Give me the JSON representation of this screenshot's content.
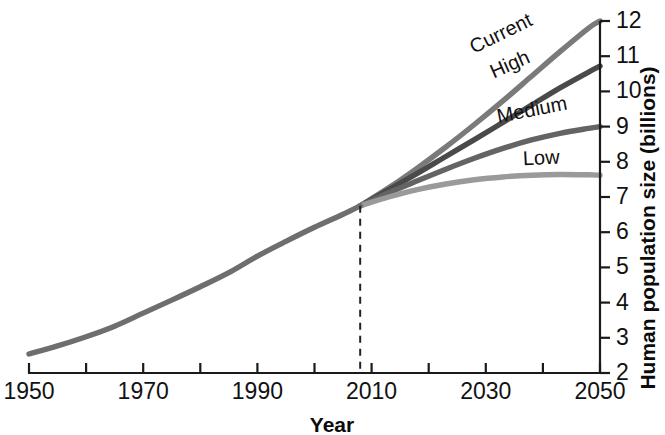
{
  "chart_data": {
    "type": "line",
    "title": "",
    "xlabel": "Year",
    "ylabel": "Human population size (billions)",
    "xlim": [
      1950,
      2050
    ],
    "ylim": [
      2,
      12
    ],
    "grid": false,
    "legend_position": "inline-end-of-line",
    "x_ticks": [
      1950,
      1960,
      1970,
      1980,
      1990,
      2000,
      2010,
      2020,
      2030,
      2040,
      2050
    ],
    "x_tick_labels": [
      "1950",
      "",
      "1970",
      "",
      "1990",
      "",
      "2010",
      "",
      "2030",
      "",
      "2050"
    ],
    "y_ticks": [
      2,
      3,
      4,
      5,
      6,
      7,
      8,
      9,
      10,
      11,
      12
    ],
    "y_tick_labels": [
      "2",
      "3",
      "4",
      "5",
      "6",
      "7",
      "8",
      "9",
      "10",
      "11",
      "12"
    ],
    "y_axis_side": "right",
    "annotations": [
      {
        "name": "present-day-marker",
        "type": "vline",
        "x": 2008,
        "style": "dashed",
        "label": ""
      }
    ],
    "x": [
      1950,
      1955,
      1960,
      1965,
      1970,
      1975,
      1980,
      1985,
      1990,
      1995,
      2000,
      2005,
      2008
    ],
    "historical": {
      "name": "Historical",
      "color": "#6e6e6e",
      "values": [
        2.54,
        2.77,
        3.03,
        3.33,
        3.7,
        4.07,
        4.45,
        4.85,
        5.32,
        5.74,
        6.14,
        6.51,
        6.75
      ]
    },
    "series": [
      {
        "name": "Current",
        "color": "#7a7a7a",
        "label": "Current",
        "x": [
          2008,
          2013,
          2018,
          2023,
          2028,
          2033,
          2038,
          2043,
          2048,
          2050
        ],
        "values": [
          6.75,
          7.26,
          7.82,
          8.42,
          9.06,
          9.73,
          10.43,
          11.13,
          11.8,
          12.0
        ],
        "end_value": 12.0
      },
      {
        "name": "High",
        "color": "#4a4a4a",
        "label": "High",
        "x": [
          2008,
          2013,
          2018,
          2023,
          2028,
          2033,
          2038,
          2043,
          2048,
          2050
        ],
        "values": [
          6.75,
          7.21,
          7.67,
          8.15,
          8.63,
          9.12,
          9.61,
          10.1,
          10.55,
          10.72
        ],
        "end_value": 10.72
      },
      {
        "name": "Medium",
        "color": "#646464",
        "label": "Medium",
        "x": [
          2008,
          2013,
          2018,
          2023,
          2028,
          2033,
          2038,
          2043,
          2048,
          2050
        ],
        "values": [
          6.75,
          7.12,
          7.46,
          7.79,
          8.1,
          8.38,
          8.62,
          8.81,
          8.95,
          9.0
        ],
        "end_value": 9.0
      },
      {
        "name": "Low",
        "color": "#9a9a9a",
        "label": "Low",
        "x": [
          2008,
          2013,
          2018,
          2023,
          2028,
          2033,
          2038,
          2043,
          2048,
          2050
        ],
        "values": [
          6.75,
          7.0,
          7.21,
          7.37,
          7.49,
          7.57,
          7.62,
          7.64,
          7.63,
          7.62
        ],
        "end_value": 7.62
      }
    ],
    "series_label_positions": [
      {
        "name": "Current",
        "x": 2027.5,
        "y": 11.2,
        "rotate": -26
      },
      {
        "name": "High",
        "x": 2031.0,
        "y": 10.5,
        "rotate": -24
      },
      {
        "name": "Medium",
        "x": 2032.0,
        "y": 9.25,
        "rotate": -11
      },
      {
        "name": "Low",
        "x": 2036.5,
        "y": 8.05,
        "rotate": -3
      }
    ]
  }
}
